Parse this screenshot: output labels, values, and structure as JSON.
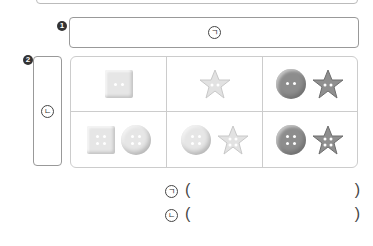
{
  "labels": {
    "q1_number": "1",
    "q2_number": "2",
    "box1_mark": "ㄱ",
    "box2_mark": "ㄴ"
  },
  "grid": {
    "rows": [
      [
        {
          "items": [
            {
              "shape": "square",
              "tone": "light",
              "holes": 2
            }
          ]
        },
        {
          "items": [
            {
              "shape": "star",
              "tone": "light",
              "holes": 2
            }
          ]
        },
        {
          "items": [
            {
              "shape": "round",
              "tone": "dark",
              "holes": 2
            },
            {
              "shape": "star",
              "tone": "dark",
              "holes": 2
            }
          ]
        }
      ],
      [
        {
          "items": [
            {
              "shape": "square",
              "tone": "light",
              "holes": 4
            },
            {
              "shape": "round",
              "tone": "light",
              "holes": 4
            }
          ]
        },
        {
          "items": [
            {
              "shape": "round",
              "tone": "light",
              "holes": 4
            },
            {
              "shape": "star",
              "tone": "light",
              "holes": 4
            }
          ]
        },
        {
          "items": [
            {
              "shape": "round",
              "tone": "dark",
              "holes": 4
            },
            {
              "shape": "star",
              "tone": "dark",
              "holes": 4
            }
          ]
        }
      ]
    ]
  },
  "answers": [
    {
      "mark": "ㄱ",
      "open": "(",
      "close": ")",
      "value": ""
    },
    {
      "mark": "ㄴ",
      "open": "(",
      "close": ")",
      "value": ""
    }
  ],
  "colors": {
    "light_button": "#e6e6e6",
    "dark_button": "#8d8d8d",
    "border": "#999999"
  }
}
